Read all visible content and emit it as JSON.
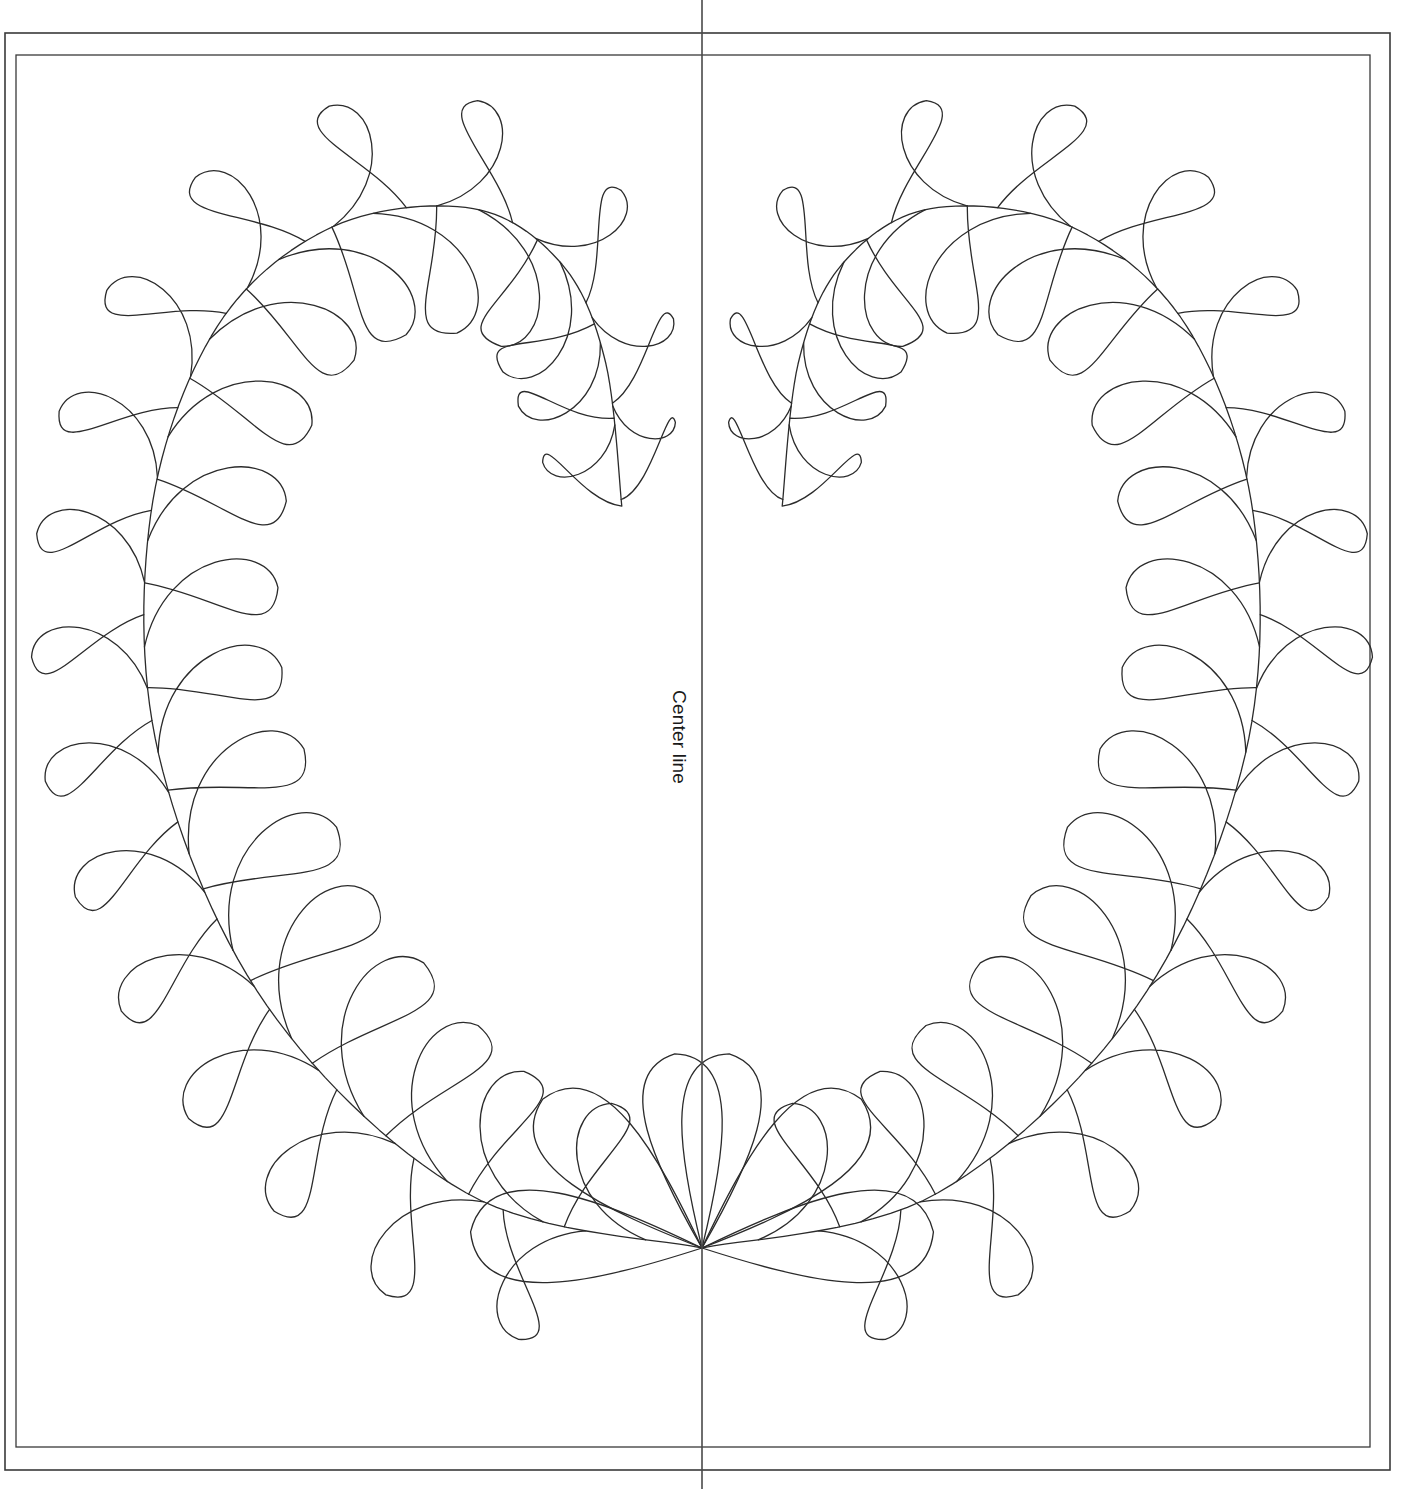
{
  "page": {
    "background_color": "#ffffff",
    "width": 1414,
    "height": 1489
  },
  "labels": {
    "center_line": "Center line"
  },
  "colors": {
    "stroke": "#2b2b2b",
    "border": "#3a3a3a",
    "center_line": "#4a4a4a",
    "background": "#ffffff"
  },
  "borders": {
    "outer": {
      "x": 5,
      "y": 33,
      "width": 1385,
      "height": 1437,
      "stroke_width": 1.6
    },
    "inner": {
      "x": 16,
      "y": 55,
      "width": 1354,
      "height": 1392,
      "stroke_width": 1.3
    }
  },
  "center_line": {
    "x": 702,
    "y_top": 0,
    "y_bottom": 1489,
    "stroke_width": 1.6,
    "label": "Center line"
  },
  "motif": {
    "type": "feathered-heart-wreath",
    "symmetry": "mirror-about-center-line",
    "bottom_point": {
      "x": 702,
      "y": 1248
    },
    "spine_tip": {
      "x": 622,
      "y": 508
    },
    "outer_feather_count": 18,
    "inner_feather_count": 17,
    "bottom_fan_feather_count": 3,
    "stroke_width": 1.3
  },
  "geometry": {
    "spine": [
      {
        "x": 702,
        "y": 1248
      },
      {
        "x": 470,
        "y": 1195
      },
      {
        "x": 270,
        "y": 1010
      },
      {
        "x": 160,
        "y": 760
      },
      {
        "x": 150,
        "y": 520
      },
      {
        "x": 215,
        "y": 330
      },
      {
        "x": 330,
        "y": 228
      },
      {
        "x": 470,
        "y": 208
      },
      {
        "x": 560,
        "y": 262
      },
      {
        "x": 605,
        "y": 360
      },
      {
        "x": 622,
        "y": 508
      }
    ],
    "outer_feathers": [
      {
        "t": 0.03,
        "len": 152,
        "w": 0.62,
        "spread": 0.58
      },
      {
        "t": 0.085,
        "len": 164,
        "w": 0.62,
        "spread": 0.56
      },
      {
        "t": 0.14,
        "len": 172,
        "w": 0.62,
        "spread": 0.54
      },
      {
        "t": 0.196,
        "len": 178,
        "w": 0.62,
        "spread": 0.52
      },
      {
        "t": 0.252,
        "len": 178,
        "w": 0.62,
        "spread": 0.5
      },
      {
        "t": 0.308,
        "len": 174,
        "w": 0.62,
        "spread": 0.48
      },
      {
        "t": 0.364,
        "len": 168,
        "w": 0.62,
        "spread": 0.47
      },
      {
        "t": 0.42,
        "len": 162,
        "w": 0.62,
        "spread": 0.46
      },
      {
        "t": 0.476,
        "len": 158,
        "w": 0.62,
        "spread": 0.45
      },
      {
        "t": 0.532,
        "len": 156,
        "w": 0.62,
        "spread": 0.44
      },
      {
        "t": 0.588,
        "len": 156,
        "w": 0.62,
        "spread": 0.44
      },
      {
        "t": 0.644,
        "len": 158,
        "w": 0.62,
        "spread": 0.44
      },
      {
        "t": 0.7,
        "len": 160,
        "w": 0.62,
        "spread": 0.44
      },
      {
        "t": 0.756,
        "len": 158,
        "w": 0.62,
        "spread": 0.45
      },
      {
        "t": 0.812,
        "len": 150,
        "w": 0.62,
        "spread": 0.47
      },
      {
        "t": 0.864,
        "len": 134,
        "w": 0.62,
        "spread": 0.5
      },
      {
        "t": 0.912,
        "len": 112,
        "w": 0.62,
        "spread": 0.54
      },
      {
        "t": 0.956,
        "len": 88,
        "w": 0.62,
        "spread": 0.58
      }
    ],
    "inner_feathers": [
      {
        "t": 0.062,
        "len": 138,
        "w": 0.66,
        "spread": 0.6
      },
      {
        "t": 0.118,
        "len": 146,
        "w": 0.66,
        "spread": 0.58
      },
      {
        "t": 0.174,
        "len": 150,
        "w": 0.66,
        "spread": 0.56
      },
      {
        "t": 0.23,
        "len": 150,
        "w": 0.66,
        "spread": 0.55
      },
      {
        "t": 0.286,
        "len": 146,
        "w": 0.66,
        "spread": 0.54
      },
      {
        "t": 0.342,
        "len": 140,
        "w": 0.66,
        "spread": 0.53
      },
      {
        "t": 0.398,
        "len": 134,
        "w": 0.66,
        "spread": 0.52
      },
      {
        "t": 0.454,
        "len": 130,
        "w": 0.66,
        "spread": 0.52
      },
      {
        "t": 0.51,
        "len": 128,
        "w": 0.66,
        "spread": 0.51
      },
      {
        "t": 0.566,
        "len": 128,
        "w": 0.66,
        "spread": 0.51
      },
      {
        "t": 0.622,
        "len": 130,
        "w": 0.66,
        "spread": 0.51
      },
      {
        "t": 0.678,
        "len": 132,
        "w": 0.66,
        "spread": 0.52
      },
      {
        "t": 0.734,
        "len": 130,
        "w": 0.66,
        "spread": 0.53
      },
      {
        "t": 0.79,
        "len": 122,
        "w": 0.66,
        "spread": 0.55
      },
      {
        "t": 0.846,
        "len": 106,
        "w": 0.66,
        "spread": 0.58
      },
      {
        "t": 0.898,
        "len": 88,
        "w": 0.66,
        "spread": 0.62
      },
      {
        "t": 0.946,
        "len": 70,
        "w": 0.66,
        "spread": 0.66
      }
    ],
    "bottom_fan": [
      {
        "angle": 184,
        "len": 232,
        "w": 0.56
      },
      {
        "angle": 223,
        "len": 218,
        "w": 0.56
      },
      {
        "angle": 262,
        "len": 196,
        "w": 0.56
      }
    ]
  }
}
